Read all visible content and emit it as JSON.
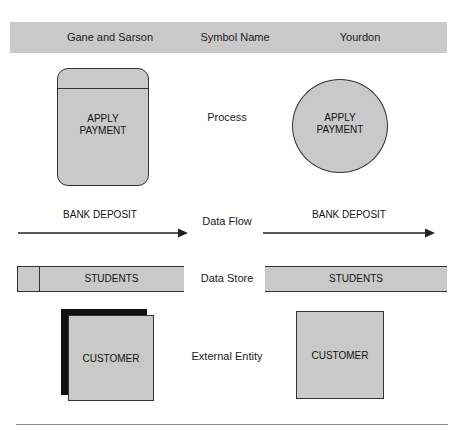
{
  "header": {
    "columns": [
      {
        "label": "Gane and Sarson"
      },
      {
        "label": "Symbol Name"
      },
      {
        "label": "Yourdon"
      }
    ]
  },
  "rows": [
    {
      "symbol_name": "Process",
      "gane_sarson": {
        "shape": "rounded-rectangle-with-top-band",
        "label": "APPLY\nPAYMENT",
        "line1": "APPLY",
        "line2": "PAYMENT"
      },
      "yourdon": {
        "shape": "circle",
        "label": "APPLY\nPAYMENT",
        "line1": "APPLY",
        "line2": "PAYMENT"
      }
    },
    {
      "symbol_name": "Data Flow",
      "gane_sarson": {
        "shape": "arrow",
        "label": "BANK DEPOSIT"
      },
      "yourdon": {
        "shape": "arrow",
        "label": "BANK DEPOSIT"
      }
    },
    {
      "symbol_name": "Data Store",
      "gane_sarson": {
        "shape": "open-rectangle-with-left-compartment",
        "label": "STUDENTS"
      },
      "yourdon": {
        "shape": "two-parallel-lines",
        "label": "STUDENTS"
      }
    },
    {
      "symbol_name": "External Entity",
      "gane_sarson": {
        "shape": "shadowed-square",
        "label": "CUSTOMER"
      },
      "yourdon": {
        "shape": "square",
        "label": "CUSTOMER"
      }
    }
  ],
  "colors": {
    "fill_gray": "#c9c9c9",
    "stroke": "#333333",
    "shadow": "#111111",
    "text": "#111111",
    "rule": "#8a8a8a",
    "background": "#ffffff"
  }
}
